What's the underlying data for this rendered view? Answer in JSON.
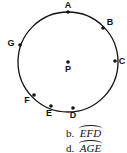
{
  "diagram": {
    "circle": {
      "cx": 68,
      "cy": 62,
      "r": 50
    },
    "center": {
      "label": "P",
      "x": 68,
      "y": 62
    },
    "points": [
      {
        "label": "A",
        "x": 68,
        "y": 12
      },
      {
        "label": "B",
        "x": 103,
        "y": 28
      },
      {
        "label": "C",
        "x": 115,
        "y": 61
      },
      {
        "label": "D",
        "x": 73,
        "y": 108
      },
      {
        "label": "E",
        "x": 51,
        "y": 106
      },
      {
        "label": "F",
        "x": 34,
        "y": 95
      },
      {
        "label": "G",
        "x": 20,
        "y": 45
      }
    ]
  },
  "options": [
    {
      "letter": "b.",
      "arc": "EFD"
    },
    {
      "letter": "d.",
      "arc": "AGE"
    }
  ]
}
